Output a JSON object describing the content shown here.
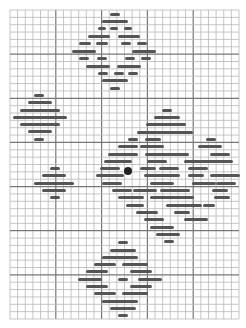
{
  "pattern": {
    "grid": {
      "x0": 10,
      "y0": 10,
      "x1": 239,
      "y1": 319,
      "cols": 30,
      "rows": 42,
      "thick_every": 6,
      "line_color": "#b8b8b8",
      "thick_color": "#777777"
    },
    "bar_color": "#555555",
    "center_dot": {
      "x": 128,
      "y": 171,
      "color": "#222222"
    },
    "bars": [
      [
        110,
        14,
        10
      ],
      [
        102,
        21,
        26
      ],
      [
        98,
        28,
        8
      ],
      [
        110,
        28,
        8
      ],
      [
        124,
        28,
        8
      ],
      [
        88,
        36,
        22
      ],
      [
        118,
        36,
        22
      ],
      [
        79,
        43,
        12
      ],
      [
        96,
        43,
        12
      ],
      [
        121,
        43,
        10
      ],
      [
        137,
        43,
        10
      ],
      [
        72,
        51,
        24
      ],
      [
        132,
        51,
        24
      ],
      [
        79,
        58,
        10
      ],
      [
        97,
        58,
        10
      ],
      [
        125,
        58,
        10
      ],
      [
        141,
        58,
        10
      ],
      [
        86,
        66,
        24
      ],
      [
        117,
        66,
        24
      ],
      [
        98,
        73,
        10
      ],
      [
        114,
        73,
        10
      ],
      [
        128,
        73,
        10
      ],
      [
        102,
        80,
        26
      ],
      [
        110,
        88,
        10
      ],
      [
        34,
        95,
        10
      ],
      [
        28,
        102,
        24
      ],
      [
        20,
        110,
        40
      ],
      [
        13,
        117,
        54
      ],
      [
        20,
        124,
        40
      ],
      [
        28,
        131,
        24
      ],
      [
        34,
        139,
        10
      ],
      [
        50,
        168,
        10
      ],
      [
        42,
        175,
        24
      ],
      [
        34,
        183,
        40
      ],
      [
        42,
        190,
        24
      ],
      [
        50,
        197,
        10
      ],
      [
        162,
        110,
        10
      ],
      [
        154,
        117,
        26
      ],
      [
        146,
        124,
        40
      ],
      [
        137,
        132,
        56
      ],
      [
        128,
        139,
        10
      ],
      [
        145,
        139,
        16
      ],
      [
        206,
        139,
        10
      ],
      [
        118,
        146,
        20
      ],
      [
        140,
        146,
        24
      ],
      [
        198,
        146,
        24
      ],
      [
        108,
        154,
        30
      ],
      [
        145,
        154,
        44
      ],
      [
        210,
        154,
        20
      ],
      [
        104,
        161,
        28
      ],
      [
        147,
        161,
        20
      ],
      [
        184,
        161,
        36
      ],
      [
        213,
        161,
        20
      ],
      [
        100,
        168,
        20
      ],
      [
        140,
        168,
        16
      ],
      [
        159,
        168,
        20
      ],
      [
        188,
        168,
        20
      ],
      [
        96,
        175,
        28
      ],
      [
        144,
        175,
        36
      ],
      [
        188,
        175,
        16
      ],
      [
        210,
        175,
        30
      ],
      [
        102,
        183,
        20
      ],
      [
        150,
        183,
        24
      ],
      [
        192,
        183,
        24
      ],
      [
        216,
        183,
        20
      ],
      [
        112,
        190,
        20
      ],
      [
        133,
        190,
        24
      ],
      [
        160,
        190,
        30
      ],
      [
        212,
        190,
        16
      ],
      [
        118,
        197,
        26
      ],
      [
        150,
        197,
        44
      ],
      [
        214,
        197,
        16
      ],
      [
        126,
        205,
        18
      ],
      [
        166,
        205,
        36
      ],
      [
        203,
        205,
        12
      ],
      [
        136,
        212,
        22
      ],
      [
        174,
        212,
        16
      ],
      [
        144,
        219,
        20
      ],
      [
        184,
        219,
        24
      ],
      [
        150,
        227,
        24
      ],
      [
        156,
        234,
        10
      ],
      [
        160,
        234,
        20
      ],
      [
        164,
        241,
        10
      ],
      [
        118,
        242,
        10
      ],
      [
        110,
        250,
        26
      ],
      [
        102,
        257,
        36
      ],
      [
        94,
        264,
        22
      ],
      [
        122,
        264,
        26
      ],
      [
        86,
        271,
        22
      ],
      [
        130,
        271,
        22
      ],
      [
        78,
        279,
        24
      ],
      [
        118,
        279,
        10
      ],
      [
        138,
        279,
        24
      ],
      [
        86,
        286,
        22
      ],
      [
        130,
        286,
        22
      ],
      [
        94,
        293,
        22
      ],
      [
        122,
        293,
        26
      ],
      [
        102,
        301,
        36
      ],
      [
        110,
        308,
        26
      ],
      [
        118,
        315,
        10
      ]
    ]
  }
}
